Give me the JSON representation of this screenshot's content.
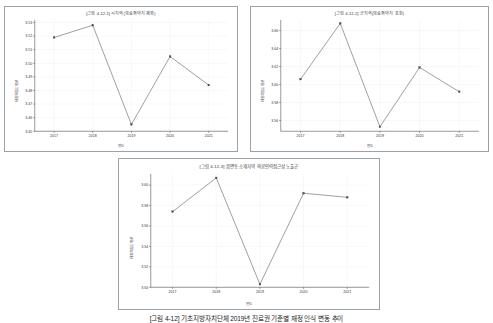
{
  "page": {
    "caption": "[그림 4-12] 기초지방자치단체 2019년 진료권 기준별 재정 인식 변동 추이"
  },
  "charts": [
    {
      "id": "chart-1",
      "title": "[그림 4-12-1] 시지역(의료취약지 제외)",
      "type": "line",
      "xlabel": "연도",
      "ylabel": "재정자립도 평균",
      "categories": [
        "2017",
        "2018",
        "2019",
        "2020",
        "2021"
      ],
      "values": [
        3.519,
        3.528,
        3.455,
        3.505,
        3.484
      ],
      "yticks": [
        "3.53",
        "3.52",
        "3.51",
        "3.50",
        "3.49",
        "3.48",
        "3.47",
        "3.46",
        "3.45"
      ],
      "ytick_values": [
        3.53,
        3.52,
        3.51,
        3.5,
        3.49,
        3.48,
        3.47,
        3.46,
        3.45
      ],
      "ylim": [
        3.45,
        3.532
      ],
      "grid": true,
      "legend": "none",
      "line_color": "#6b6b6b",
      "marker_color": "#4a4a4a"
    },
    {
      "id": "chart-2",
      "title": "[그림 4-12-2] 군지역(의료취약지 포함)",
      "type": "line",
      "xlabel": "연도",
      "ylabel": "재정자립도 평균",
      "categories": [
        "2017",
        "2018",
        "2019",
        "2020",
        "2021"
      ],
      "values": [
        3.606,
        3.668,
        3.553,
        3.619,
        3.592
      ],
      "yticks": [
        "3.66",
        "3.64",
        "3.62",
        "3.60",
        "3.58",
        "3.56"
      ],
      "ytick_values": [
        3.66,
        3.64,
        3.62,
        3.6,
        3.58,
        3.56
      ],
      "ylim": [
        3.548,
        3.672
      ],
      "grid": true,
      "legend": "none",
      "line_color": "#6b6b6b",
      "marker_color": "#4a4a4a"
    },
    {
      "id": "chart-3",
      "title": "[그림 4-12-3] 읍면동 소재지역 의료인력접근성 노출군",
      "type": "line",
      "xlabel": "연도",
      "ylabel": "재정자립도 평균",
      "categories": [
        "2017",
        "2018",
        "2019",
        "2020",
        "2021"
      ],
      "values": [
        3.574,
        3.607,
        3.503,
        3.592,
        3.588
      ],
      "yticks": [
        "3.60",
        "3.58",
        "3.56",
        "3.54",
        "3.52",
        "3.50"
      ],
      "ytick_values": [
        3.6,
        3.58,
        3.56,
        3.54,
        3.52,
        3.5
      ],
      "ylim": [
        3.5,
        3.611
      ],
      "grid": true,
      "legend": "none",
      "line_color": "#6b6b6b",
      "marker_color": "#4a4a4a"
    }
  ],
  "chart_data": [
    {
      "type": "line",
      "title": "[그림 4-12-1] 시지역(의료취약지 제외)",
      "xlabel": "연도",
      "ylabel": "재정자립도 평균",
      "categories": [
        "2017",
        "2018",
        "2019",
        "2020",
        "2021"
      ],
      "values": [
        3.519,
        3.528,
        3.455,
        3.505,
        3.484
      ],
      "ylim": [
        3.45,
        3.532
      ],
      "yticks": [
        3.53,
        3.52,
        3.51,
        3.5,
        3.49,
        3.48,
        3.47,
        3.46,
        3.45
      ],
      "grid": true,
      "legend": "none"
    },
    {
      "type": "line",
      "title": "[그림 4-12-2] 군지역(의료취약지 포함)",
      "xlabel": "연도",
      "ylabel": "재정자립도 평균",
      "categories": [
        "2017",
        "2018",
        "2019",
        "2020",
        "2021"
      ],
      "values": [
        3.606,
        3.668,
        3.553,
        3.619,
        3.592
      ],
      "ylim": [
        3.548,
        3.672
      ],
      "yticks": [
        3.66,
        3.64,
        3.62,
        3.6,
        3.58,
        3.56
      ],
      "grid": true,
      "legend": "none"
    },
    {
      "type": "line",
      "title": "[그림 4-12-3] 읍면동 소재지역 의료인력접근성 노출군",
      "xlabel": "연도",
      "ylabel": "재정자립도 평균",
      "categories": [
        "2017",
        "2018",
        "2019",
        "2020",
        "2021"
      ],
      "values": [
        3.574,
        3.607,
        3.503,
        3.592,
        3.588
      ],
      "ylim": [
        3.5,
        3.611
      ],
      "yticks": [
        3.6,
        3.58,
        3.56,
        3.54,
        3.52,
        3.5
      ],
      "grid": true,
      "legend": "none"
    }
  ]
}
